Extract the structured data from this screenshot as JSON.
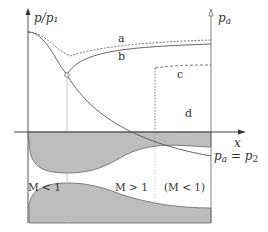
{
  "figure": {
    "type": "converging-diverging nozzle pressure distribution",
    "y_axis_left_label": "p/p₁",
    "y_axis_right_label": "p",
    "y_axis_right_sub": "a",
    "x_axis_label": "x",
    "curves": [
      {
        "id": "a",
        "label": "a",
        "style": "dashed"
      },
      {
        "id": "b",
        "label": "b",
        "style": "solid"
      },
      {
        "id": "c",
        "label": "c",
        "style": "dashed"
      },
      {
        "id": "d",
        "label": "d",
        "style": "solid"
      }
    ],
    "exit_condition": {
      "lhs": "p",
      "lhs_sub": "a",
      "eq": " = ",
      "rhs": "p",
      "rhs_sub": "2"
    },
    "regions": [
      {
        "label": "M < 1"
      },
      {
        "label": "M > 1"
      },
      {
        "label": "(M < 1)"
      }
    ],
    "colors": {
      "line": "#555555",
      "wall_fill": "#bdbdbd",
      "guide": "#cccccc"
    }
  }
}
